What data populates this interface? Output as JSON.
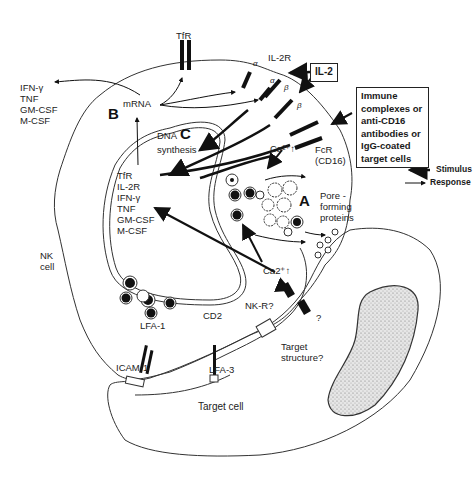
{
  "figure": {
    "regions": {
      "A": "A",
      "B": "B",
      "C": "C"
    },
    "labels": {
      "tfr_top": "TfR",
      "il2r": "IL-2R",
      "il2": "IL-2",
      "alpha1": "α",
      "alpha2": "α",
      "beta1": "β",
      "beta2": "β",
      "mrna": "mRNA",
      "dna": "DNA",
      "synthesis": "synthesis",
      "ca_upper": "Ca²⁺↑",
      "ca_lower": "Ca2⁺↑",
      "fcr": "FcR",
      "cd16": "(CD16)",
      "pore": [
        "Pore -",
        "forming",
        "proteins"
      ],
      "nk_cell": [
        "NK",
        "cell"
      ],
      "lfa1": "LFA-1",
      "icam1": "ICAM-1",
      "cd2": "CD2",
      "lfa3": "LFA-3",
      "nkr": "NK-R?",
      "question": "?",
      "target_structure": [
        "Target",
        "structure?"
      ],
      "target_cell": "Target cell"
    },
    "secreted_list": [
      "IFN-γ",
      "TNF",
      "GM-CSF",
      "M-CSF"
    ],
    "nuclear_list": [
      "TfR",
      "IL-2R",
      "IFN-γ",
      "TNF",
      "GM-CSF",
      "M-CSF"
    ],
    "stimulus_box": [
      "Immune",
      "complexes or",
      "anti-CD16",
      "antibodies or",
      "IgG-coated",
      "target cells"
    ],
    "legend": [
      {
        "label": "Stimulus",
        "style": "thick"
      },
      {
        "label": "Response",
        "style": "thin"
      }
    ]
  }
}
